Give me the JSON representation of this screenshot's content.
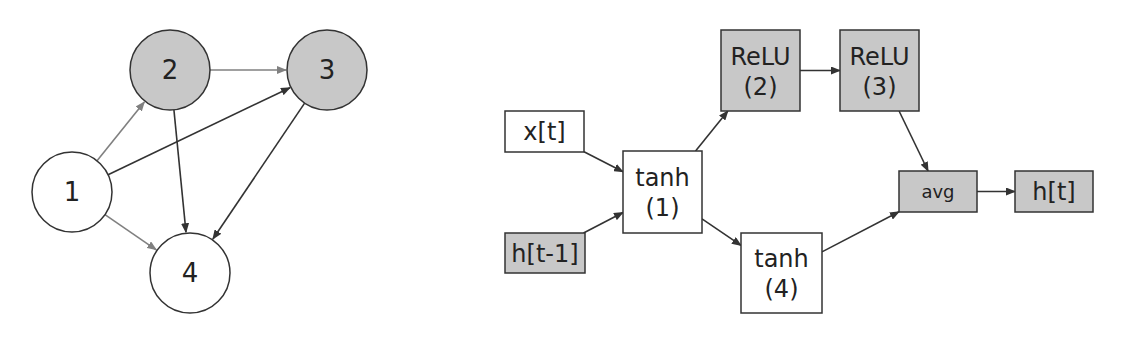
{
  "colors": {
    "shaded": "#c8c8c8",
    "white": "#ffffff",
    "stroke": "#333333",
    "edge_dark": "#333333",
    "edge_gray": "#808080"
  },
  "graph": {
    "nodes": [
      {
        "id": "1",
        "label": "1",
        "cx": 72,
        "cy": 192,
        "shaded": false
      },
      {
        "id": "2",
        "label": "2",
        "cx": 170,
        "cy": 70,
        "shaded": true
      },
      {
        "id": "3",
        "label": "3",
        "cx": 327,
        "cy": 70,
        "shaded": true
      },
      {
        "id": "4",
        "label": "4",
        "cx": 190,
        "cy": 273,
        "shaded": false
      }
    ],
    "edges": [
      {
        "from": "1",
        "to": "2",
        "color": "gray"
      },
      {
        "from": "1",
        "to": "3",
        "color": "dark"
      },
      {
        "from": "1",
        "to": "4",
        "color": "gray"
      },
      {
        "from": "2",
        "to": "3",
        "color": "gray"
      },
      {
        "from": "2",
        "to": "4",
        "color": "dark"
      },
      {
        "from": "3",
        "to": "4",
        "color": "dark"
      }
    ]
  },
  "cell": {
    "boxes": [
      {
        "id": "xt",
        "line1": "x[t]",
        "line2": "",
        "x": 505,
        "y": 111,
        "w": 79,
        "h": 41,
        "shaded": false
      },
      {
        "id": "ht1",
        "line1": "h[t-1]",
        "line2": "",
        "x": 505,
        "y": 233,
        "w": 80,
        "h": 40,
        "shaded": true
      },
      {
        "id": "tanh1",
        "line1": "tanh",
        "line2": "(1)",
        "x": 623,
        "y": 151,
        "w": 79,
        "h": 82,
        "shaded": false
      },
      {
        "id": "relu2",
        "line1": "ReLU",
        "line2": "(2)",
        "x": 721,
        "y": 30,
        "w": 79,
        "h": 81,
        "shaded": true
      },
      {
        "id": "relu3",
        "line1": "ReLU",
        "line2": "(3)",
        "x": 840,
        "y": 30,
        "w": 79,
        "h": 81,
        "shaded": true
      },
      {
        "id": "tanh4",
        "line1": "tanh",
        "line2": "(4)",
        "x": 741,
        "y": 233,
        "w": 81,
        "h": 80,
        "shaded": false
      },
      {
        "id": "avg",
        "line1": "avg",
        "line2": "",
        "x": 899,
        "y": 171,
        "w": 78,
        "h": 41,
        "shaded": true,
        "small": true
      },
      {
        "id": "ht",
        "line1": "h[t]",
        "line2": "",
        "x": 1015,
        "y": 171,
        "w": 78,
        "h": 41,
        "shaded": true
      }
    ],
    "edges": [
      {
        "from": "xt",
        "to": "tanh1"
      },
      {
        "from": "ht1",
        "to": "tanh1"
      },
      {
        "from": "tanh1",
        "to": "relu2"
      },
      {
        "from": "tanh1",
        "to": "tanh4"
      },
      {
        "from": "relu2",
        "to": "relu3"
      },
      {
        "from": "relu3",
        "to": "avg"
      },
      {
        "from": "tanh4",
        "to": "avg"
      },
      {
        "from": "avg",
        "to": "ht"
      }
    ]
  }
}
